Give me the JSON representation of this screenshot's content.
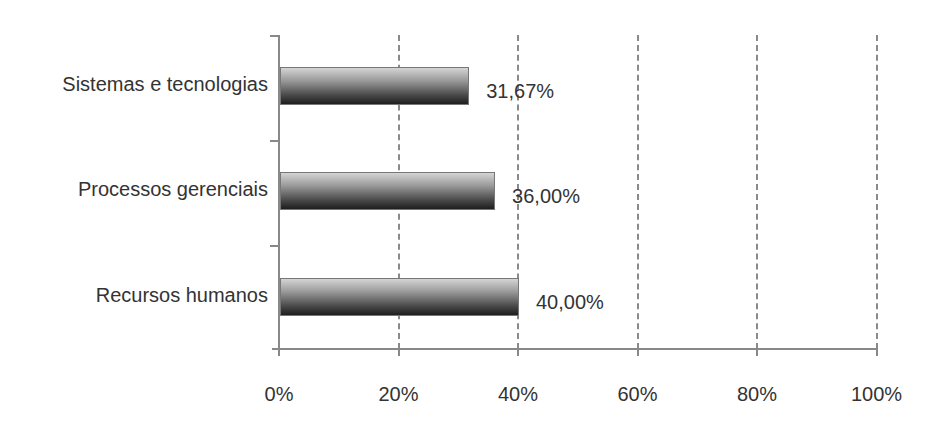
{
  "chart_data": {
    "type": "bar",
    "orientation": "horizontal",
    "title": "",
    "xlabel": "",
    "ylabel": "",
    "categories": [
      "Sistemas e tecnologias",
      "Processos gerenciais",
      "Recursos humanos"
    ],
    "values": [
      31.67,
      36.0,
      40.0
    ],
    "value_labels": [
      "31,67%",
      "36,00%",
      "40,00%"
    ],
    "xlim": [
      0,
      100
    ],
    "x_ticks": [
      "0%",
      "20%",
      "40%",
      "60%",
      "80%",
      "100%"
    ],
    "grid": "vertical dashed",
    "legend": "none"
  }
}
